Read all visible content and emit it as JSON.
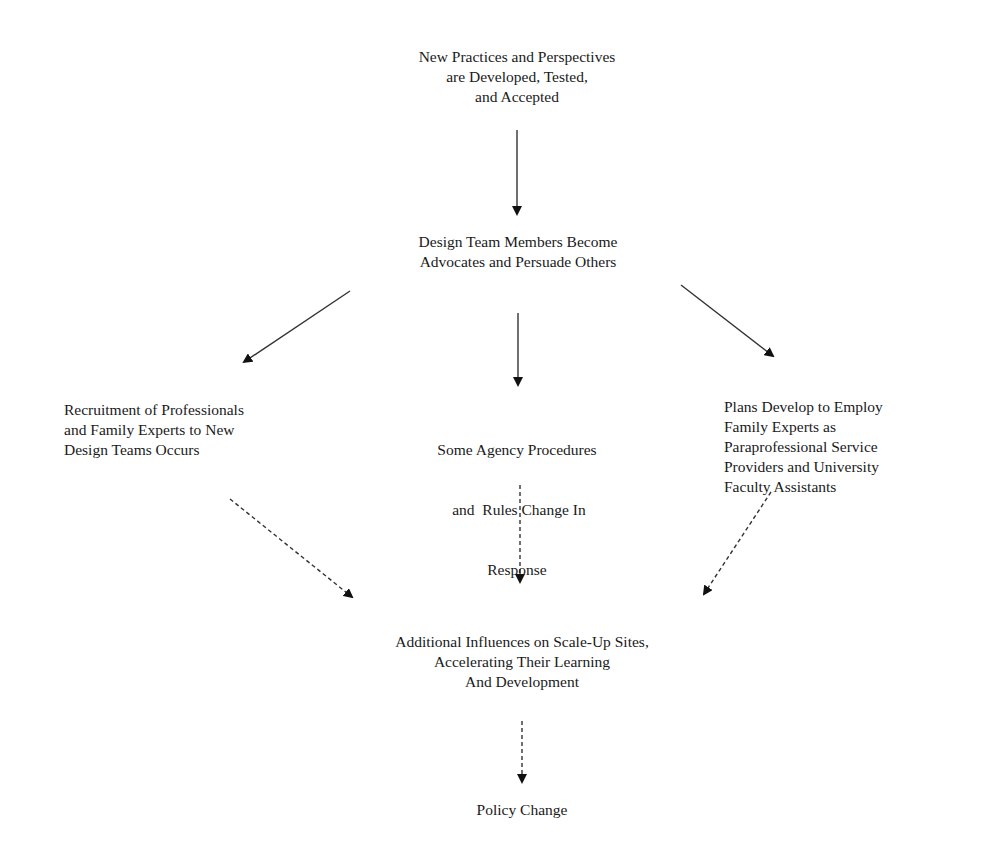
{
  "diagram": {
    "type": "flowchart",
    "nodes": {
      "new_practices": {
        "lines": [
          "New Practices and Perspectives",
          "are Developed, Tested,",
          "and Accepted"
        ]
      },
      "advocates": {
        "lines": [
          "Design Team Members Become",
          "Advocates and Persuade Others"
        ]
      },
      "recruitment": {
        "lines": [
          "Recruitment of Professionals",
          "and Family Experts to New",
          "Design Teams Occurs"
        ]
      },
      "agency_procedures": {
        "lines": [
          "Some Agency Procedures",
          " and  Rules Change In",
          "Response"
        ]
      },
      "plans_develop": {
        "lines": [
          "Plans Develop to Employ",
          "Family Experts as",
          "Paraprofessional Service",
          "Providers and University",
          "Faculty Assistants"
        ]
      },
      "additional_influences": {
        "lines": [
          "Additional Influences on Scale-Up Sites,",
          "Accelerating Their Learning",
          "And Development"
        ]
      },
      "policy_change": {
        "lines": [
          "Policy Change"
        ]
      }
    },
    "edges": [
      {
        "from": "new_practices",
        "to": "advocates",
        "style": "solid"
      },
      {
        "from": "advocates",
        "to": "recruitment",
        "style": "solid"
      },
      {
        "from": "advocates",
        "to": "agency_procedures",
        "style": "solid"
      },
      {
        "from": "advocates",
        "to": "plans_develop",
        "style": "solid"
      },
      {
        "from": "recruitment",
        "to": "additional_influences",
        "style": "dashed"
      },
      {
        "from": "agency_procedures",
        "to": "additional_influences",
        "style": "dashed"
      },
      {
        "from": "plans_develop",
        "to": "additional_influences",
        "style": "dashed"
      },
      {
        "from": "additional_influences",
        "to": "policy_change",
        "style": "dashed"
      }
    ],
    "colors": {
      "text": "#1a1a1a",
      "arrow": "#222222",
      "background": "#ffffff"
    }
  }
}
